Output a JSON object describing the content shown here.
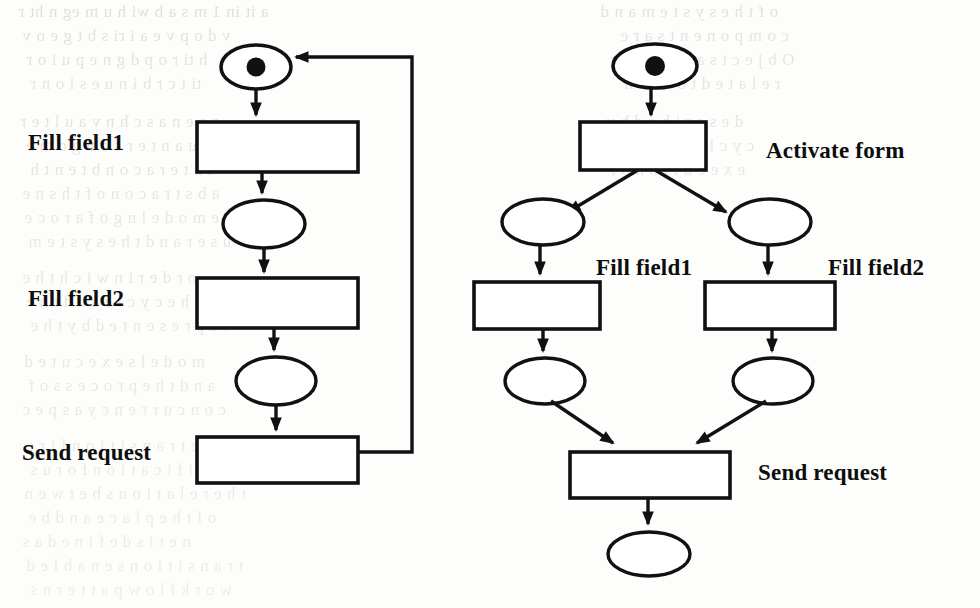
{
  "page": {
    "kind": "scanned-paper-figure",
    "width": 980,
    "height": 608,
    "background_color": "#fdfdfc",
    "ink_color": "#111111",
    "ghost_text_color": "#c9c8c4"
  },
  "figure": {
    "caption": "",
    "nets": [
      {
        "id": "sequential-net",
        "name": "Sequential Petri net with feedback loop",
        "labels": [
          {
            "key": "fill-field1",
            "text": "Fill field1"
          },
          {
            "key": "fill-field2",
            "text": "Fill field2"
          },
          {
            "key": "send-request",
            "text": "Send request"
          }
        ],
        "places": [
          {
            "id": "p0",
            "marked": true,
            "tokens": 1
          },
          {
            "id": "p1",
            "marked": false,
            "tokens": 0
          },
          {
            "id": "p2",
            "marked": false,
            "tokens": 0
          }
        ],
        "transitions": [
          {
            "id": "t1",
            "label": "Fill field1"
          },
          {
            "id": "t2",
            "label": "Fill field2"
          },
          {
            "id": "t3",
            "label": "Send request"
          }
        ],
        "arcs": [
          {
            "from": "p0",
            "to": "t1"
          },
          {
            "from": "t1",
            "to": "p1"
          },
          {
            "from": "p1",
            "to": "t2"
          },
          {
            "from": "t2",
            "to": "p2"
          },
          {
            "from": "p2",
            "to": "t3"
          },
          {
            "from": "t3",
            "to": "p0",
            "style": "loop-back"
          }
        ]
      },
      {
        "id": "parallel-net",
        "name": "Parallel (AND-split / AND-join) Petri net",
        "labels": [
          {
            "key": "activate-form",
            "text": "Activate form"
          },
          {
            "key": "fill-field1",
            "text": "Fill field1"
          },
          {
            "key": "fill-field2",
            "text": "Fill field2"
          },
          {
            "key": "send-request",
            "text": "Send request"
          }
        ],
        "places": [
          {
            "id": "q0",
            "marked": true,
            "tokens": 1
          },
          {
            "id": "q1",
            "marked": false,
            "tokens": 0
          },
          {
            "id": "q2",
            "marked": false,
            "tokens": 0
          },
          {
            "id": "q3",
            "marked": false,
            "tokens": 0
          },
          {
            "id": "q4",
            "marked": false,
            "tokens": 0
          },
          {
            "id": "q5",
            "marked": false,
            "tokens": 0
          }
        ],
        "transitions": [
          {
            "id": "u0",
            "label": "Activate form"
          },
          {
            "id": "u1",
            "label": "Fill field1"
          },
          {
            "id": "u2",
            "label": "Fill field2"
          },
          {
            "id": "u3",
            "label": "Send request"
          }
        ],
        "arcs": [
          {
            "from": "q0",
            "to": "u0"
          },
          {
            "from": "u0",
            "to": "q1",
            "style": "split-left"
          },
          {
            "from": "u0",
            "to": "q2",
            "style": "split-right"
          },
          {
            "from": "q1",
            "to": "u1"
          },
          {
            "from": "q2",
            "to": "u2"
          },
          {
            "from": "u1",
            "to": "q3"
          },
          {
            "from": "u2",
            "to": "q4"
          },
          {
            "from": "q3",
            "to": "u3",
            "style": "join-left"
          },
          {
            "from": "q4",
            "to": "u3",
            "style": "join-right"
          },
          {
            "from": "u3",
            "to": "q5"
          }
        ]
      }
    ]
  },
  "labels": {
    "left_fill_field1": "Fill field1",
    "left_fill_field2": "Fill field2",
    "left_send_request": "Send request",
    "right_activate_form": "Activate form",
    "right_fill_field1": "Fill field1",
    "right_fill_field2": "Fill field2",
    "right_send_request": "Send request"
  },
  "background_text": {
    "description": "Faint mirrored bleed-through text from the reverse side of the scanned page; individual words are illegible.",
    "lines": [
      {
        "text": "a  it  in   1 m  s a b wi h  u  m eg n  ht  r",
        "left": 18,
        "top": 2,
        "size": 17,
        "opacity": 0.55
      },
      {
        "text": "v   d  o  p    v e  a i   ri   s  b  t  g  e   o  v",
        "left": 22,
        "top": 26,
        "size": 17,
        "opacity": 0.5
      },
      {
        "text": "h   ti   r  o  p   d   g  n    e   p  u  i  o   r",
        "left": 26,
        "top": 50,
        "size": 17,
        "opacity": 0.48
      },
      {
        "text": "ti    t  c  r  b  i  n  u   e  s  i   o n   r",
        "left": 30,
        "top": 74,
        "size": 17,
        "opacity": 0.45
      },
      {
        "text": "r  o  e  n  a  s  c  h  n  v  a  u   l  t    e  r",
        "left": 20,
        "top": 112,
        "size": 17,
        "opacity": 0.48
      },
      {
        "text": "s  e  r  u  a  n  t  e  r   c  o  n   g  o   m  e",
        "left": 26,
        "top": 136,
        "size": 17,
        "opacity": 0.45
      },
      {
        "text": "i  n  t   e  r  a  c  o  n   b   t   e  n    t  h",
        "left": 30,
        "top": 160,
        "size": 17,
        "opacity": 0.45
      },
      {
        "text": "a  b  s  t  r  a  c   o  n   o  f   t  h   s   n  e",
        "left": 22,
        "top": 184,
        "size": 17,
        "opacity": 0.42
      },
      {
        "text": "e  m  o  d  e  l   n  g   o  f   a    r  o  c  e",
        "left": 24,
        "top": 208,
        "size": 17,
        "opacity": 0.42
      },
      {
        "text": "u  s  e  r   a  n  d   t  h  e   s  y  s  t  e  m",
        "left": 28,
        "top": 232,
        "size": 17,
        "opacity": 0.4
      },
      {
        "text": "o  r  d  e  r   i  n   w   i  c  h   t  h  e",
        "left": 22,
        "top": 268,
        "size": 17,
        "opacity": 0.42
      },
      {
        "text": "t  h  e   c  y  c  l  e   a  n  d   t  h  e",
        "left": 26,
        "top": 292,
        "size": 17,
        "opacity": 0.42
      },
      {
        "text": "r  e  p  r  e  s  e  n  t  e  d   b  y   t  h  e",
        "left": 30,
        "top": 316,
        "size": 17,
        "opacity": 0.4
      },
      {
        "text": "m  o  d  e  l   s   e  x  e  c  u  t  e  d",
        "left": 24,
        "top": 352,
        "size": 17,
        "opacity": 0.4
      },
      {
        "text": "a  n  d   t  h  e   p  r  o  c  e  s  s   o  f",
        "left": 28,
        "top": 376,
        "size": 17,
        "opacity": 0.38
      },
      {
        "text": "c  o  n  c  u  r  r  e  n  c  y   a  s  p  e  c",
        "left": 22,
        "top": 400,
        "size": 17,
        "opacity": 0.38
      },
      {
        "text": "t  h  e   t  r  a  n  s  i  t  i  o  n   f  i  r  e",
        "left": 26,
        "top": 436,
        "size": 17,
        "opacity": 0.38
      },
      {
        "text": "s  p  e  c  i  f  i  c  a  t  i  o  n   f  o  r   u  s",
        "left": 30,
        "top": 460,
        "size": 17,
        "opacity": 0.36
      },
      {
        "text": "t  h  e   r  e  l  a  t  i  o  n  s   b  e  t  w  e  n",
        "left": 24,
        "top": 484,
        "size": 17,
        "opacity": 0.36
      },
      {
        "text": "o  f   t  h  e   p  l  a  c  e   a  n  d   b  e",
        "left": 28,
        "top": 508,
        "size": 17,
        "opacity": 0.34
      },
      {
        "text": "n  e  t   i  s   d  e  f  i  n  e  d   a  s",
        "left": 22,
        "top": 532,
        "size": 17,
        "opacity": 0.34
      },
      {
        "text": "t  r  a  n  s  i  t  i  o  n   s   e  n  a  b  l  e  d",
        "left": 26,
        "top": 556,
        "size": 17,
        "opacity": 0.32
      },
      {
        "text": "w  o  r  k  f  l  o  w   p  a  t  t  e  r  n  s",
        "left": 30,
        "top": 580,
        "size": 17,
        "opacity": 0.3
      }
    ],
    "right_lines": [
      {
        "text": "o  f   t  h  e   s  y  s  t  e  m   a  n  d",
        "left": 600,
        "top": 2,
        "size": 17,
        "opacity": 0.5
      },
      {
        "text": "c  o  m  p  o  n  e  n  t  s   a  r  e",
        "left": 620,
        "top": 26,
        "size": 17,
        "opacity": 0.48
      },
      {
        "text": "O  b  j  e  c  t  s   a  n  d   t  h  e  i  r",
        "left": 610,
        "top": 50,
        "size": 17,
        "opacity": 0.46
      },
      {
        "text": "r  e  l  a  t  e  d   t  o   e  a  c  h",
        "left": 624,
        "top": 74,
        "size": 17,
        "opacity": 0.44
      },
      {
        "text": "d  e  s  c  r  i  b  e  d   b  y",
        "left": 606,
        "top": 112,
        "size": 17,
        "opacity": 0.44
      },
      {
        "text": "c  y  c  l  e   a  n  d   t  h  e",
        "left": 618,
        "top": 136,
        "size": 17,
        "opacity": 0.42
      },
      {
        "text": "e  x  e  c  u  t  i  o  n   o  f",
        "left": 610,
        "top": 160,
        "size": 17,
        "opacity": 0.4
      }
    ]
  }
}
